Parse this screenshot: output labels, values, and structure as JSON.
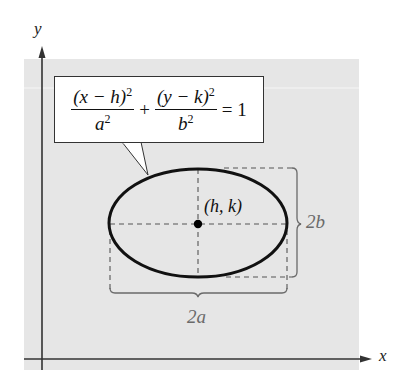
{
  "diagram": {
    "axes": {
      "x_label": "x",
      "y_label": "y"
    },
    "equation": {
      "term1_numerator": "(x − h)",
      "term1_numerator_exp": "2",
      "term1_denominator": "a",
      "term1_denominator_exp": "2",
      "plus": "+",
      "term2_numerator": "(y − k)",
      "term2_numerator_exp": "2",
      "term2_denominator": "b",
      "term2_denominator_exp": "2",
      "equals": "= 1"
    },
    "center_label": "(h, k)",
    "major_axis_label": "2a",
    "minor_axis_label": "2b",
    "colors": {
      "background_panel": "#e6e6e6",
      "ellipse_stroke": "#111111",
      "dashed_lines": "#555555",
      "brace": "#6a6a6a",
      "dimension_labels": "#6a6a6a",
      "axes": "#333333"
    }
  }
}
